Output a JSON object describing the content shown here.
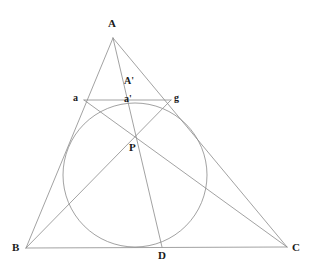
{
  "figure": {
    "background_color": "#ffffff",
    "stroke_color": "#8a8a8a",
    "label_color": "#1a1a1a",
    "width": 313,
    "height": 279
  },
  "labels": {
    "A": "A",
    "A_prime": "A'",
    "a": "a",
    "a_prime": "a'",
    "g": "g",
    "P": "P",
    "B": "B",
    "C": "C",
    "D": "D"
  },
  "points": {
    "A": {
      "x": 113,
      "y": 38
    },
    "B": {
      "x": 26,
      "y": 248
    },
    "C": {
      "x": 287,
      "y": 247
    },
    "D": {
      "x": 162,
      "y": 247
    },
    "a": {
      "x": 84,
      "y": 100
    },
    "g": {
      "x": 171,
      "y": 100
    },
    "a_prime": {
      "x": 130,
      "y": 101
    },
    "P": {
      "x": 134,
      "y": 137
    }
  },
  "circle": {
    "center": {
      "x": 135,
      "y": 175
    },
    "radius": 72
  },
  "label_positions": {
    "A": {
      "x": 108,
      "y": 18
    },
    "A_prime": {
      "x": 124,
      "y": 76
    },
    "a": {
      "x": 73,
      "y": 93
    },
    "a_prime": {
      "x": 124,
      "y": 94
    },
    "g": {
      "x": 174,
      "y": 93
    },
    "P": {
      "x": 129,
      "y": 142
    },
    "B": {
      "x": 12,
      "y": 242
    },
    "C": {
      "x": 292,
      "y": 242
    },
    "D": {
      "x": 158,
      "y": 250
    }
  },
  "segments": [
    {
      "name": "side-AB",
      "from": "A",
      "to": "B"
    },
    {
      "name": "side-AC",
      "from": "A",
      "to": "C"
    },
    {
      "name": "side-BC",
      "from": "B",
      "to": "C"
    },
    {
      "name": "cevian-AD",
      "from": "A",
      "to": "D"
    },
    {
      "name": "chord-ag",
      "from": "a",
      "to": "g"
    },
    {
      "name": "cevian-B-to-g",
      "from": "B",
      "to": "g"
    },
    {
      "name": "cevian-C-to-a",
      "from": "C",
      "to": "a"
    }
  ]
}
